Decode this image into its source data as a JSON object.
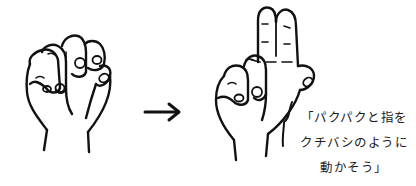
{
  "illustration": {
    "left_hand": {
      "pose": "fist (all fingers closed)"
    },
    "arrow": {
      "direction": "right"
    },
    "right_hand": {
      "pose": "index and middle fingers extended together (chopstick/beak shape)"
    },
    "caption": {
      "lines": [
        "「パクパクと指を",
        "クチバシのように",
        "動かそう」"
      ]
    },
    "colors": {
      "line": "#111111",
      "background": "#ffffff"
    }
  }
}
